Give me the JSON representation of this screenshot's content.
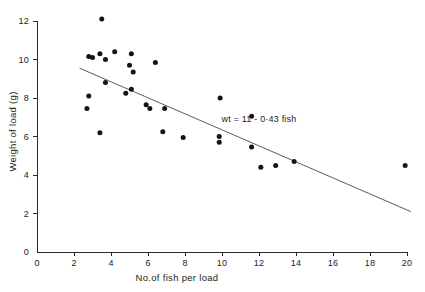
{
  "chart_data": {
    "type": "scatter",
    "title": "",
    "xlabel": "No.of fish per load",
    "ylabel": "Weight of load (g)",
    "xlim": [
      0,
      20
    ],
    "ylim": [
      0,
      12
    ],
    "grid": false,
    "legend": "none",
    "x_ticks": [
      0,
      2,
      4,
      6,
      8,
      10,
      12,
      14,
      16,
      18,
      20
    ],
    "x_tick_labels": [
      "0",
      "2",
      "4",
      "6",
      "8",
      "10",
      "12",
      "14",
      "16",
      "18",
      "20"
    ],
    "y_ticks": [
      0,
      2,
      4,
      6,
      8,
      10,
      12
    ],
    "y_tick_labels": [
      "0",
      "2",
      "4",
      "6",
      "8",
      "10",
      "12"
    ],
    "points": [
      {
        "x": 3.5,
        "y": 12.1
      },
      {
        "x": 2.8,
        "y": 10.15
      },
      {
        "x": 3.0,
        "y": 10.1
      },
      {
        "x": 3.4,
        "y": 10.3
      },
      {
        "x": 3.7,
        "y": 10.0
      },
      {
        "x": 4.2,
        "y": 10.4
      },
      {
        "x": 5.1,
        "y": 10.3
      },
      {
        "x": 6.4,
        "y": 9.85
      },
      {
        "x": 5.0,
        "y": 9.7
      },
      {
        "x": 5.2,
        "y": 9.35
      },
      {
        "x": 3.7,
        "y": 8.8
      },
      {
        "x": 2.8,
        "y": 8.1
      },
      {
        "x": 4.8,
        "y": 8.25
      },
      {
        "x": 5.1,
        "y": 8.45
      },
      {
        "x": 2.7,
        "y": 7.45
      },
      {
        "x": 5.9,
        "y": 7.65
      },
      {
        "x": 6.1,
        "y": 7.45
      },
      {
        "x": 6.9,
        "y": 7.45
      },
      {
        "x": 9.9,
        "y": 8.0
      },
      {
        "x": 11.6,
        "y": 7.05
      },
      {
        "x": 3.4,
        "y": 6.2
      },
      {
        "x": 6.8,
        "y": 6.25
      },
      {
        "x": 7.9,
        "y": 5.95
      },
      {
        "x": 9.85,
        "y": 6.0
      },
      {
        "x": 9.85,
        "y": 5.7
      },
      {
        "x": 11.6,
        "y": 5.45
      },
      {
        "x": 12.1,
        "y": 4.4
      },
      {
        "x": 12.9,
        "y": 4.5
      },
      {
        "x": 13.9,
        "y": 4.7
      },
      {
        "x": 19.9,
        "y": 4.5
      }
    ],
    "fit_line": {
      "equation_label": "wt = 11 - 0·43 fish",
      "intercept": 11,
      "slope": -0.43,
      "x_start": 2.3,
      "x_end": 20.2,
      "y_start": 9.55,
      "y_end": 2.1
    },
    "annotations": [
      {
        "text": "wt = 11 - 0·43 fish",
        "x": 12.0,
        "y": 6.75
      }
    ],
    "colors": {
      "point": "#141414",
      "line": "#4a4a4a",
      "axis": "#2a2a2a",
      "background": "#ffffff"
    }
  }
}
